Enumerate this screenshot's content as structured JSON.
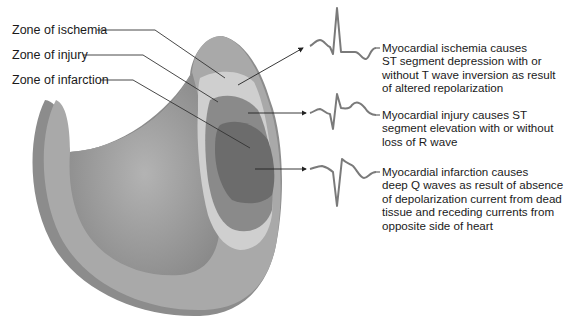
{
  "zone_labels": [
    {
      "id": "ischemia",
      "label": "Zone of ischemia"
    },
    {
      "id": "injury",
      "label": "Zone of injury"
    },
    {
      "id": "infarction",
      "label": "Zone of infarction"
    }
  ],
  "descriptions": [
    {
      "id": "ischemia",
      "lines": [
        "Myocardial ischemia causes",
        "ST segment depression with or",
        "without T wave inversion as result",
        "of altered repolarization"
      ]
    },
    {
      "id": "injury",
      "lines": [
        "Myocardial injury causes ST",
        "segment elevation with or without",
        "loss of R wave"
      ]
    },
    {
      "id": "infarction",
      "lines": [
        "Myocardial infarction causes",
        "deep Q waves as result of absence",
        "of depolarization current from dead",
        "tissue and receding currents from",
        "opposite side of heart"
      ]
    }
  ],
  "colors": {
    "wall": "#a9a9a9",
    "wall_dark": "#8c8c8c",
    "cavity": "#9a9a9a",
    "ischemia": "#cfcfcf",
    "injury": "#8a8a8a",
    "infarction": "#6c6c6c",
    "ecg_trace": "#7a7a7a",
    "leader_line": "#333333"
  }
}
